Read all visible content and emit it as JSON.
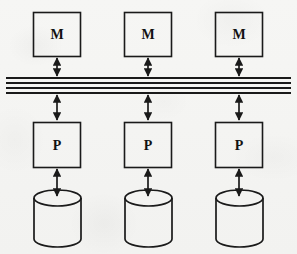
{
  "diagram": {
    "background_color": "#f4f4f2",
    "stroke_color": "#1a1a1a",
    "columns": [
      {
        "index": 0,
        "center_x": 57,
        "memory": {
          "label": "M",
          "name": "memory-module"
        },
        "processor": {
          "label": "P",
          "name": "processor-module"
        },
        "storage": {
          "label": "",
          "name": "disk-cylinder"
        }
      },
      {
        "index": 1,
        "center_x": 148,
        "memory": {
          "label": "M",
          "name": "memory-module"
        },
        "processor": {
          "label": "P",
          "name": "processor-module"
        },
        "storage": {
          "label": "",
          "name": "disk-cylinder"
        }
      },
      {
        "index": 2,
        "center_x": 239,
        "memory": {
          "label": "M",
          "name": "memory-module"
        },
        "processor": {
          "label": "P",
          "name": "processor-module"
        },
        "storage": {
          "label": "",
          "name": "disk-cylinder"
        }
      }
    ],
    "bus": {
      "name": "system-bus",
      "line_count": 4,
      "x_start": 6,
      "x_end": 291,
      "line_y": [
        78,
        83,
        88,
        93
      ]
    },
    "geometry": {
      "box_width": 47,
      "memory_box_top": 12,
      "memory_box_bottom": 56,
      "processor_box_top": 122,
      "processor_box_bottom": 168,
      "cylinder_left_offset": -23,
      "cylinder_width": 47,
      "cylinder_top": 190,
      "cylinder_bottom": 247,
      "cylinder_ellipse_ry": 8
    },
    "connectors": [
      {
        "name": "memory-to-bus-link",
        "from": "memory",
        "to": "bus",
        "arrowheads": "both"
      },
      {
        "name": "bus-to-processor-link",
        "from": "bus",
        "to": "processor",
        "arrowheads": "both"
      },
      {
        "name": "processor-to-disk-link",
        "from": "processor",
        "to": "storage",
        "arrowheads": "both"
      }
    ]
  }
}
